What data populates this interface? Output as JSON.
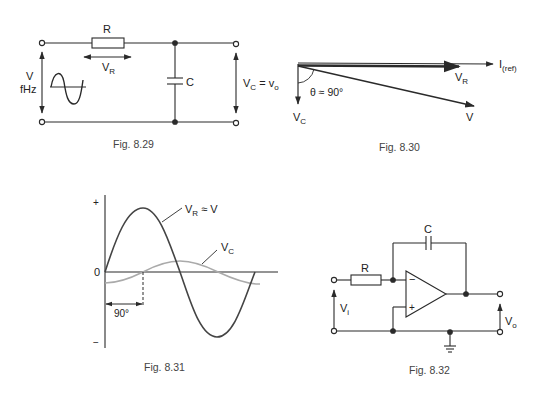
{
  "figures": [
    {
      "id": "fig-8-29",
      "caption": "Fig. 8.29",
      "type": "RC series circuit",
      "labels": {
        "resistor": "R",
        "resistor_voltage": "V",
        "resistor_voltage_sub": "R",
        "source_voltage": "V",
        "source_freq": "fHz",
        "capacitor": "C",
        "output": "V",
        "output_sub": "C",
        "output_eq": " = v",
        "output_eq_sub": "o"
      }
    },
    {
      "id": "fig-8-30",
      "caption": "Fig. 8.30",
      "type": "phasor diagram",
      "labels": {
        "reference": "I",
        "reference_sub": "(ref)",
        "vr": "V",
        "vr_sub": "R",
        "v": "V",
        "vc": "V",
        "vc_sub": "C",
        "angle": "θ ≈ 90°"
      }
    },
    {
      "id": "fig-8-31",
      "caption": "Fig. 8.31",
      "type": "waveform plot",
      "labels": {
        "plus": "+",
        "minus": "−",
        "zero": "0",
        "vr_curve": "V",
        "vr_curve_sub": "R",
        "vr_curve_eq": " ≈ V",
        "vc_curve": "V",
        "vc_curve_sub": "C",
        "phase": "90°"
      }
    },
    {
      "id": "fig-8-32",
      "caption": "Fig. 8.32",
      "type": "op-amp integrator",
      "labels": {
        "capacitor": "C",
        "resistor": "R",
        "inverting": "−",
        "noninverting": "+",
        "input": "V",
        "input_sub": "i",
        "output": "V",
        "output_sub": "o"
      }
    }
  ],
  "colors": {
    "line": "#2a2a2a",
    "vc_curve": "#aaaaaa"
  }
}
